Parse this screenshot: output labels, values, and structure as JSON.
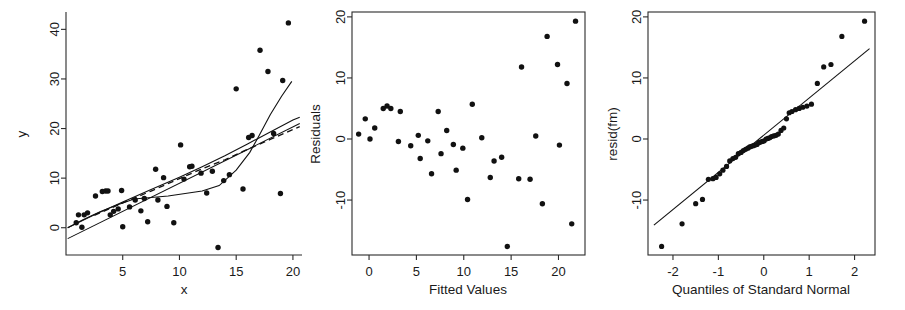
{
  "figure": {
    "title": "",
    "panel_count": 3,
    "background": "#ffffff",
    "point_color": "#111111",
    "line_color": "#111111"
  },
  "chart_data": [
    {
      "type": "scatter",
      "name": "panel-1-xy",
      "title": "",
      "xlabel": "x",
      "ylabel": "y",
      "xlim": [
        0,
        20.8
      ],
      "ylim": [
        -5.5,
        43.5
      ],
      "xticks": [
        5,
        10,
        15,
        20
      ],
      "xticklabels": [
        "5",
        "10",
        "15",
        "20"
      ],
      "yticks": [
        0,
        10,
        20,
        30,
        40
      ],
      "yticklabels": [
        "0",
        "10",
        "20",
        "30",
        "40"
      ],
      "grid": false,
      "legend": "none",
      "points": [
        [
          0.9,
          1.0
        ],
        [
          1.1,
          2.6
        ],
        [
          1.4,
          0.1
        ],
        [
          1.6,
          2.6
        ],
        [
          1.9,
          3.0
        ],
        [
          2.6,
          6.4
        ],
        [
          3.2,
          7.3
        ],
        [
          3.5,
          7.4
        ],
        [
          3.7,
          7.4
        ],
        [
          3.9,
          2.6
        ],
        [
          4.2,
          3.3
        ],
        [
          4.6,
          3.8
        ],
        [
          4.9,
          7.5
        ],
        [
          5.0,
          0.2
        ],
        [
          5.6,
          4.2
        ],
        [
          6.1,
          5.6
        ],
        [
          6.6,
          3.4
        ],
        [
          6.9,
          5.9
        ],
        [
          7.2,
          1.2
        ],
        [
          7.9,
          11.8
        ],
        [
          8.1,
          5.6
        ],
        [
          8.6,
          10.1
        ],
        [
          8.9,
          4.3
        ],
        [
          9.5,
          1.0
        ],
        [
          10.1,
          16.7
        ],
        [
          10.4,
          9.8
        ],
        [
          10.9,
          12.3
        ],
        [
          11.1,
          12.4
        ],
        [
          11.9,
          11.0
        ],
        [
          12.4,
          7.0
        ],
        [
          12.9,
          11.4
        ],
        [
          13.4,
          -4.0
        ],
        [
          13.9,
          9.5
        ],
        [
          14.4,
          10.7
        ],
        [
          15.0,
          28.0
        ],
        [
          15.6,
          7.8
        ],
        [
          16.1,
          18.2
        ],
        [
          16.4,
          18.6
        ],
        [
          17.1,
          35.8
        ],
        [
          17.8,
          31.5
        ],
        [
          18.3,
          19.0
        ],
        [
          18.9,
          6.9
        ],
        [
          19.1,
          29.7
        ],
        [
          19.6,
          41.3
        ]
      ],
      "series_lines": [
        {
          "name": "least-squares-line",
          "style": "solid",
          "x": [
            0.15,
            20.6
          ],
          "y": [
            -2.2,
            21.0
          ]
        },
        {
          "name": "smooth-curve-solid",
          "style": "solid",
          "x": [
            0.15,
            1.5,
            3.0,
            4.5,
            6.0,
            7.5,
            9.0,
            10.5,
            12.0,
            13.5,
            15.0,
            16.2,
            17.0,
            18.0,
            19.0,
            19.9
          ],
          "y": [
            0.0,
            1.6,
            3.2,
            4.6,
            5.8,
            6.1,
            6.4,
            6.9,
            7.4,
            8.5,
            11.6,
            15.2,
            18.5,
            22.8,
            26.5,
            29.5
          ]
        },
        {
          "name": "robust-curve-solid",
          "style": "solid",
          "x": [
            0.15,
            2.5,
            5.0,
            7.5,
            10.0,
            12.0,
            14.0,
            16.0,
            18.0,
            20.0,
            20.6
          ],
          "y": [
            0.0,
            2.6,
            5.2,
            7.7,
            10.2,
            12.3,
            14.5,
            16.9,
            19.3,
            21.7,
            22.3
          ]
        },
        {
          "name": "smooth-curve-dashed",
          "style": "dashed",
          "x": [
            2.5,
            5.0,
            7.5,
            10.0,
            12.0,
            14.0,
            16.0,
            18.0,
            20.0,
            20.6
          ],
          "y": [
            2.5,
            5.0,
            7.4,
            9.9,
            11.9,
            13.7,
            15.8,
            17.8,
            19.8,
            20.4
          ]
        }
      ]
    },
    {
      "type": "scatter",
      "name": "panel-2-residuals",
      "title": "",
      "xlabel": "Fitted Values",
      "ylabel": "Residuals",
      "xlim": [
        -1.8,
        22.8
      ],
      "ylim": [
        -19.0,
        20.8
      ],
      "xticks": [
        0,
        5,
        10,
        15,
        20
      ],
      "xticklabels": [
        "0",
        "5",
        "10",
        "15",
        "20"
      ],
      "yticks": [
        -10,
        0,
        10,
        20
      ],
      "yticklabels": [
        "-10",
        "0",
        "10",
        "20"
      ],
      "grid": false,
      "legend": "none",
      "points": [
        [
          -1.1,
          0.8
        ],
        [
          -0.4,
          3.3
        ],
        [
          0.1,
          0.0
        ],
        [
          0.6,
          1.8
        ],
        [
          1.5,
          5.0
        ],
        [
          1.9,
          5.4
        ],
        [
          2.3,
          5.0
        ],
        [
          3.1,
          -0.4
        ],
        [
          3.3,
          4.5
        ],
        [
          4.4,
          -1.1
        ],
        [
          5.2,
          0.6
        ],
        [
          5.4,
          -3.2
        ],
        [
          6.2,
          -0.3
        ],
        [
          6.6,
          -5.7
        ],
        [
          7.3,
          4.5
        ],
        [
          7.6,
          -2.4
        ],
        [
          8.2,
          1.4
        ],
        [
          8.9,
          -0.9
        ],
        [
          9.2,
          -5.1
        ],
        [
          9.9,
          -1.5
        ],
        [
          10.4,
          -9.9
        ],
        [
          10.9,
          5.7
        ],
        [
          11.9,
          0.2
        ],
        [
          12.8,
          -6.3
        ],
        [
          13.2,
          -3.6
        ],
        [
          14.0,
          -3.0
        ],
        [
          14.6,
          -17.6
        ],
        [
          15.8,
          -6.5
        ],
        [
          16.1,
          11.8
        ],
        [
          17.0,
          -6.6
        ],
        [
          17.6,
          0.5
        ],
        [
          18.3,
          -10.6
        ],
        [
          18.8,
          16.8
        ],
        [
          19.9,
          12.2
        ],
        [
          20.1,
          -1.0
        ],
        [
          20.9,
          9.1
        ],
        [
          21.4,
          -13.9
        ],
        [
          21.8,
          19.3
        ]
      ]
    },
    {
      "type": "scatter",
      "name": "panel-3-qq",
      "title": "",
      "xlabel": "Quantiles of Standard Normal",
      "ylabel": "resid(fm)",
      "xlim": [
        -2.55,
        2.45
      ],
      "ylim": [
        -19.0,
        20.8
      ],
      "xticks": [
        -2,
        -1,
        0,
        1,
        2
      ],
      "xticklabels": [
        "-2",
        "-1",
        "0",
        "1",
        "2"
      ],
      "yticks": [
        -10,
        0,
        10,
        20
      ],
      "yticklabels": [
        "-10",
        "0",
        "10",
        "20"
      ],
      "grid": false,
      "legend": "none",
      "points": [
        [
          -2.25,
          -17.6
        ],
        [
          -1.8,
          -13.9
        ],
        [
          -1.5,
          -10.6
        ],
        [
          -1.35,
          -9.9
        ],
        [
          -1.22,
          -6.6
        ],
        [
          -1.12,
          -6.5
        ],
        [
          -1.05,
          -6.3
        ],
        [
          -0.97,
          -5.7
        ],
        [
          -0.9,
          -5.1
        ],
        [
          -0.82,
          -4.5
        ],
        [
          -0.75,
          -3.6
        ],
        [
          -0.68,
          -3.2
        ],
        [
          -0.62,
          -3.0
        ],
        [
          -0.56,
          -2.4
        ],
        [
          -0.5,
          -2.2
        ],
        [
          -0.45,
          -1.9
        ],
        [
          -0.4,
          -1.7
        ],
        [
          -0.35,
          -1.5
        ],
        [
          -0.31,
          -1.3
        ],
        [
          -0.27,
          -1.2
        ],
        [
          -0.23,
          -1.1
        ],
        [
          -0.19,
          -1.0
        ],
        [
          -0.15,
          -0.9
        ],
        [
          -0.11,
          -0.6
        ],
        [
          -0.07,
          -0.5
        ],
        [
          -0.03,
          -0.4
        ],
        [
          0.01,
          -0.3
        ],
        [
          0.05,
          0.0
        ],
        [
          0.09,
          0.1
        ],
        [
          0.13,
          0.2
        ],
        [
          0.17,
          0.4
        ],
        [
          0.22,
          0.5
        ],
        [
          0.27,
          0.6
        ],
        [
          0.32,
          0.8
        ],
        [
          0.38,
          1.4
        ],
        [
          0.44,
          1.8
        ],
        [
          0.5,
          3.3
        ],
        [
          0.56,
          4.3
        ],
        [
          0.62,
          4.5
        ],
        [
          0.7,
          4.8
        ],
        [
          0.78,
          5.0
        ],
        [
          0.86,
          5.2
        ],
        [
          0.95,
          5.4
        ],
        [
          1.05,
          5.7
        ],
        [
          1.18,
          9.1
        ],
        [
          1.32,
          11.8
        ],
        [
          1.48,
          12.2
        ],
        [
          1.72,
          16.8
        ],
        [
          2.22,
          19.3
        ]
      ],
      "reference_line": {
        "name": "qq-reference-line",
        "style": "solid",
        "x": [
          -2.42,
          2.33
        ],
        "y": [
          -14.1,
          14.8
        ]
      }
    }
  ]
}
